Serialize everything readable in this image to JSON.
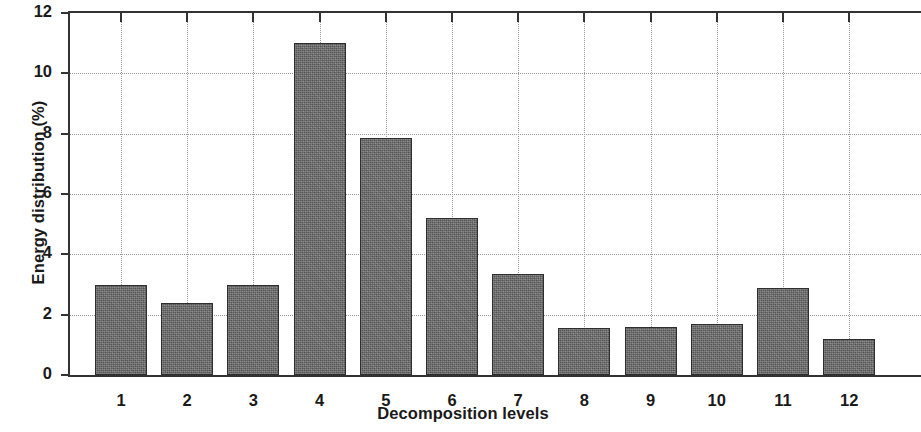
{
  "chart_data": {
    "type": "bar",
    "title": "",
    "xlabel": "Decomposition levels",
    "ylabel": "Energy distribution (%)",
    "categories": [
      "1",
      "2",
      "3",
      "4",
      "5",
      "6",
      "7",
      "8",
      "9",
      "10",
      "11",
      "12"
    ],
    "values": [
      3.0,
      2.4,
      3.0,
      11.0,
      7.85,
      5.2,
      3.35,
      1.55,
      1.6,
      1.7,
      2.9,
      1.2
    ],
    "ylim": [
      0,
      12
    ],
    "ytick_labels": [
      "0",
      "2",
      "4",
      "6",
      "8",
      "10",
      "12"
    ],
    "ytick_values": [
      0,
      2,
      4,
      6,
      8,
      10,
      12
    ],
    "grid": true,
    "grid_style": "dotted",
    "legend": "none",
    "bar_color": "#6e6e6e",
    "bar_edge_color": "#2e2e2e",
    "axis_color": "#333333",
    "grid_color": "#9a9a9a",
    "background_color": "#ffffff"
  }
}
